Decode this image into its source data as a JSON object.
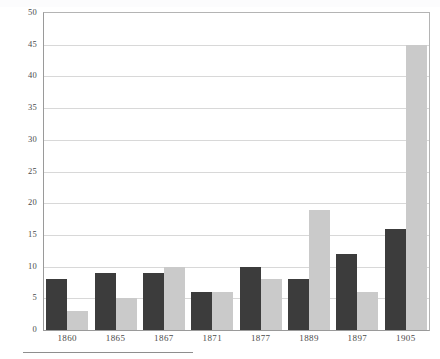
{
  "chart_data": {
    "type": "bar",
    "title": "",
    "subtitle": "",
    "xlabel": "",
    "ylabel": "",
    "categories": [
      "1860",
      "1865",
      "1867",
      "1871",
      "1877",
      "1889",
      "1897",
      "1905"
    ],
    "series": [
      {
        "name": "dark",
        "color": "#3c3c3c",
        "values": [
          8,
          9,
          9,
          6,
          10,
          8,
          12,
          16
        ]
      },
      {
        "name": "light",
        "color": "#cacaca",
        "values": [
          3,
          5,
          10,
          6,
          8,
          19,
          6,
          45
        ]
      }
    ],
    "ylim": [
      0,
      50
    ],
    "ytick_step": 5,
    "yticks": [
      "0",
      "5",
      "10",
      "15",
      "20",
      "25",
      "30",
      "35",
      "40",
      "45",
      "50"
    ],
    "grid": true,
    "grid_axis": "y",
    "legend": false,
    "legend_position": "none",
    "frame": true,
    "annotations": []
  },
  "figure": {
    "footer_rule": true
  }
}
